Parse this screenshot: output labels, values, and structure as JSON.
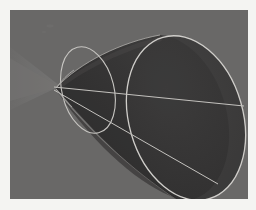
{
  "page": {
    "background_color": "#f4f4f2",
    "width": 256,
    "height": 210
  },
  "figure": {
    "name": "right-circular-cone-oblique-view",
    "description": "Grayscale 3D shaded rendering of a single nappe of a right circular cone seen obliquely, apex at left, circular base rendered as a large tilted ellipse at right, with an inner ellipse marking a plane section and a straight axis line running from apex through the base.",
    "frame": {
      "x": 10,
      "y": 10,
      "width": 238,
      "height": 189,
      "background_color": "#666564",
      "border_color": "#f4f4f2"
    },
    "colors": {
      "background_gray": "#666564",
      "cone_body_dark": "#2c2b2b",
      "cone_body_darkest": "#232222",
      "cone_body_mid": "#3a3938",
      "shadow_wedge": "#717070",
      "shadow_wedge_soft": "#6d6c6b",
      "line_light": "#d8d6d2",
      "line_dim": "#a9a7a3"
    },
    "geometry": {
      "apex": {
        "x": 46,
        "y": 78
      },
      "base_ellipse": {
        "center_x": 176,
        "center_y": 108,
        "radius_x": 57,
        "radius_y": 84,
        "rotation_deg": -16,
        "stroke": "#d8d6d2",
        "stroke_width": 1.3
      },
      "section_ellipse": {
        "center_x": 78,
        "center_y": 80,
        "radius_x": 26,
        "radius_y": 44,
        "rotation_deg": -14,
        "stroke": "#cfcdc9",
        "stroke_width": 1.1
      },
      "axis_line": {
        "x1": 44,
        "y1": 77,
        "x2": 234,
        "y2": 96,
        "stroke": "#cbc9c5",
        "stroke_width": 1.0
      },
      "generator_line": {
        "x1": 44,
        "y1": 80,
        "x2": 208,
        "y2": 174,
        "stroke": "#cbc9c5",
        "stroke_width": 1.0
      },
      "shadow_wedge": {
        "apex_x": 48,
        "apex_y": 76,
        "left_top_y": 38,
        "left_bottom_y": 96
      }
    },
    "elements": [
      {
        "id": "cone-surface",
        "label": "Cone lateral surface"
      },
      {
        "id": "base-ellipse",
        "label": "Base circle (ellipse in projection)"
      },
      {
        "id": "section-ellipse",
        "label": "Conic section ellipse"
      },
      {
        "id": "axis-line",
        "label": "Cone axis"
      },
      {
        "id": "generator-line",
        "label": "Generator line"
      },
      {
        "id": "shadow-wedge",
        "label": "Cast shadow wedge"
      }
    ]
  }
}
